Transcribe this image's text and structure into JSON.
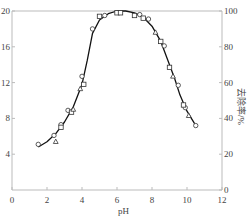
{
  "chart_data": {
    "type": "scatter",
    "title": "",
    "xlabel": "pH",
    "ylabel_left": "",
    "ylabel_right": "去除率/%",
    "xlim": [
      0,
      12
    ],
    "ylim_left": [
      0,
      20
    ],
    "ylim_right": [
      0,
      100
    ],
    "x_ticks": [
      "0",
      "2",
      "4",
      "6",
      "8",
      "10",
      "12"
    ],
    "y_left_ticks": [
      "4",
      "8",
      "12",
      "16",
      "20"
    ],
    "y_right_ticks": [
      "0",
      "20",
      "40",
      "60",
      "80",
      "100"
    ],
    "grid": false,
    "legend": null,
    "series": [
      {
        "name": "fit curve",
        "style": "line",
        "x": [
          1.5,
          2.0,
          2.5,
          3.0,
          3.5,
          4.0,
          4.3,
          4.6,
          5.0,
          5.5,
          6.0,
          6.5,
          7.0,
          7.5,
          8.0,
          8.5,
          9.0,
          9.3,
          9.6,
          10.0,
          10.5
        ],
        "y": [
          4.8,
          5.4,
          6.3,
          7.6,
          9.3,
          11.8,
          14.5,
          17.5,
          19.0,
          19.7,
          20.0,
          20.0,
          19.8,
          19.3,
          18.3,
          16.6,
          14.0,
          12.4,
          10.6,
          8.8,
          7.2
        ]
      },
      {
        "name": "circles",
        "style": "circle",
        "x": [
          1.5,
          2.4,
          2.8,
          3.2,
          4.0,
          4.6,
          5.3,
          7.3,
          7.8,
          8.7,
          9.5,
          9.9,
          10.5
        ],
        "y": [
          5.1,
          6.1,
          7.3,
          8.9,
          12.7,
          18.0,
          19.5,
          19.6,
          19.1,
          16.1,
          11.7,
          9.2,
          7.2
        ]
      },
      {
        "name": "squares",
        "style": "square",
        "x": [
          2.8,
          3.4,
          4.1,
          5.0,
          6.0,
          6.2,
          7.0,
          7.5,
          8.5,
          9.0,
          9.8
        ],
        "y": [
          7.0,
          8.7,
          11.8,
          19.4,
          19.8,
          19.8,
          19.5,
          19.2,
          16.6,
          13.7,
          9.5
        ]
      },
      {
        "name": "triangles",
        "style": "triangle",
        "x": [
          2.5,
          3.5,
          3.9,
          8.2,
          9.2,
          10.1
        ],
        "y": [
          5.4,
          9.0,
          11.3,
          17.6,
          12.7,
          8.3
        ]
      }
    ]
  }
}
